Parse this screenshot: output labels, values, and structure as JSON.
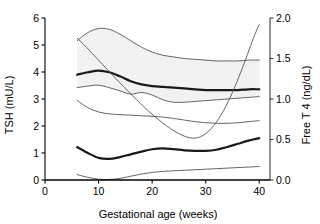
{
  "chart_data": {
    "type": "line",
    "title": "",
    "xlabel": "Gestational age (weeks)",
    "ylabel": "TSH (mU/L)",
    "y2label": "Free T 4 (ng/dL)",
    "xlim": [
      0,
      42
    ],
    "ylim": [
      0,
      6
    ],
    "y2lim": [
      0.0,
      2.0
    ],
    "xticks": [
      0,
      10,
      20,
      30,
      40
    ],
    "xtick_labels": [
      "0",
      "10",
      "20",
      "30",
      "40"
    ],
    "yticks": [
      0,
      1,
      2,
      3,
      4,
      5,
      6
    ],
    "ytick_labels": [
      "0",
      "1",
      "2",
      "3",
      "4",
      "5",
      "6"
    ],
    "y2ticks": [
      0.0,
      0.5,
      1.0,
      1.5,
      2.0
    ],
    "y2tick_labels": [
      "0.0",
      "0.5",
      "1.0",
      "1.5",
      "2.0"
    ],
    "grid": false,
    "legend": "none",
    "x": [
      6,
      8,
      10,
      12,
      14,
      16,
      18,
      20,
      22,
      24,
      26,
      28,
      30,
      32,
      34,
      36,
      38,
      40
    ],
    "series": [
      {
        "name": "Free T4 median",
        "axis": "right",
        "unit": "ng/dL",
        "style": "thick",
        "values": [
          1.3,
          1.33,
          1.35,
          1.33,
          1.28,
          1.22,
          1.18,
          1.16,
          1.15,
          1.14,
          1.13,
          1.12,
          1.11,
          1.11,
          1.11,
          1.11,
          1.12,
          1.12
        ]
      },
      {
        "name": "Free T4 upper limit",
        "axis": "right",
        "unit": "ng/dL",
        "style": "thin",
        "values": [
          1.72,
          1.82,
          1.87,
          1.86,
          1.8,
          1.72,
          1.64,
          1.58,
          1.54,
          1.52,
          1.5,
          1.49,
          1.48,
          1.47,
          1.47,
          1.47,
          1.48,
          1.48
        ]
      },
      {
        "name": "Free T4 lower limit",
        "axis": "right",
        "unit": "ng/dL",
        "style": "thin",
        "values": [
          1.14,
          1.16,
          1.17,
          1.14,
          1.1,
          1.06,
          1.08,
          1.05,
          0.99,
          0.96,
          0.96,
          0.97,
          0.98,
          0.99,
          1.0,
          1.01,
          1.02,
          1.03
        ]
      },
      {
        "name": "TSH median",
        "axis": "left",
        "unit": "mU/L",
        "style": "thick",
        "values": [
          1.22,
          1.0,
          0.82,
          0.78,
          0.85,
          0.95,
          1.05,
          1.14,
          1.17,
          1.14,
          1.1,
          1.08,
          1.08,
          1.12,
          1.22,
          1.34,
          1.46,
          1.55
        ]
      },
      {
        "name": "TSH upper limit",
        "axis": "left",
        "unit": "mU/L",
        "style": "thin",
        "values": [
          2.95,
          2.68,
          2.52,
          2.45,
          2.42,
          2.4,
          2.38,
          2.36,
          2.33,
          2.28,
          2.22,
          2.16,
          2.12,
          2.1,
          2.1,
          2.12,
          2.16,
          2.2
        ]
      },
      {
        "name": "TSH lower limit",
        "axis": "left",
        "unit": "mU/L",
        "style": "thin",
        "values": [
          0.2,
          0.1,
          0.03,
          0.02,
          0.06,
          0.14,
          0.22,
          0.28,
          0.32,
          0.34,
          0.36,
          0.38,
          0.4,
          0.42,
          0.44,
          0.46,
          0.48,
          0.5
        ]
      },
      {
        "name": "Reference diagonal",
        "axis": "left",
        "unit": "mU/L",
        "style": "thin-diagonal",
        "x": [
          6,
          28,
          40
        ],
        "values": [
          5.25,
          1.55,
          5.75
        ]
      }
    ],
    "bands": [
      {
        "name": "Free T4 reference band",
        "axis": "right",
        "upper": "Free T4 upper limit",
        "lower": "Free T4 lower limit",
        "fill": "#f2f2f2"
      }
    ],
    "colors": {
      "axis": "#000000",
      "thick_line": "#1a1a1a",
      "thin_line": "#555555",
      "band_fill": "#f2f2f2",
      "background": "#ffffff"
    }
  }
}
